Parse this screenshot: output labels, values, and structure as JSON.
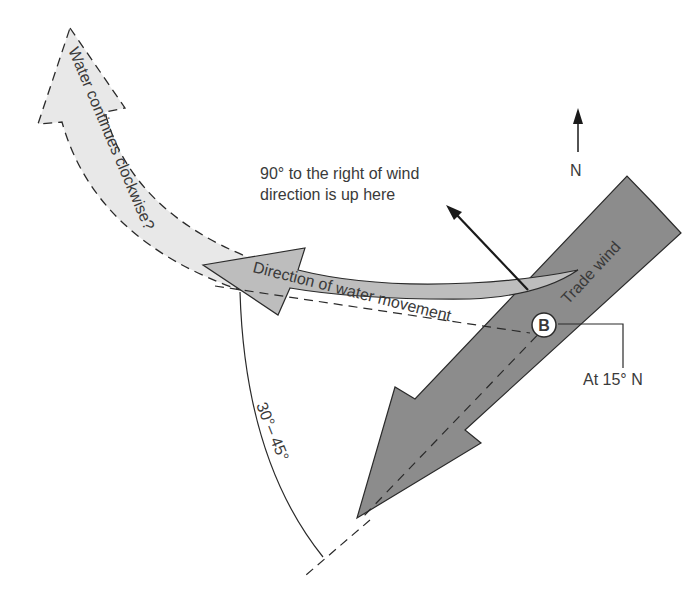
{
  "diagram": {
    "labels": {
      "water_continues": "Water continues clockwise?",
      "water_movement": "Direction of water movement",
      "trade_wind": "Trade wind",
      "ninety_line1": "90° to the right of wind",
      "ninety_line2": "direction is up here",
      "north": "N",
      "point_b": "B",
      "latitude": "At 15° N",
      "angle": "30°– 45°"
    },
    "colors": {
      "trade_wind_fill": "#8c8c8c",
      "water_movement_fill": "#bdbdbd",
      "continues_fill": "#e8e8e8",
      "stroke": "#2a2a2a",
      "text": "#3a3a3a"
    }
  }
}
